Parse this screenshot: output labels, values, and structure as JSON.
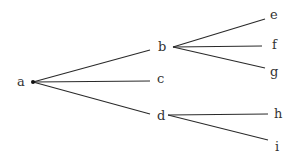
{
  "diagram": {
    "type": "tree",
    "nodes": [
      {
        "id": "a",
        "label": "a",
        "x": 17,
        "y": 86,
        "anchor": [
          33,
          82
        ]
      },
      {
        "id": "b",
        "label": "b",
        "x": 158,
        "y": 51,
        "anchor": [
          173,
          47
        ]
      },
      {
        "id": "c",
        "label": "c",
        "x": 157,
        "y": 83,
        "anchor": [
          150,
          80
        ]
      },
      {
        "id": "d",
        "label": "d",
        "x": 157,
        "y": 120,
        "anchor": [
          170,
          115
        ]
      },
      {
        "id": "e",
        "label": "e",
        "x": 270,
        "y": 19,
        "anchor": [
          264,
          19
        ]
      },
      {
        "id": "f",
        "label": "f",
        "x": 272,
        "y": 49,
        "anchor": [
          262,
          45
        ]
      },
      {
        "id": "g",
        "label": "g",
        "x": 270,
        "y": 76,
        "anchor": [
          264,
          68
        ]
      },
      {
        "id": "h",
        "label": "h",
        "x": 274,
        "y": 118,
        "anchor": [
          267,
          114
        ]
      },
      {
        "id": "i",
        "label": "i",
        "x": 275,
        "y": 151,
        "anchor": [
          267,
          140
        ]
      }
    ],
    "edges": [
      {
        "from": "a",
        "to": "b",
        "x1": 33,
        "y1": 82,
        "x2": 150,
        "y2": 50
      },
      {
        "from": "a",
        "to": "c",
        "x1": 33,
        "y1": 82,
        "x2": 150,
        "y2": 81
      },
      {
        "from": "a",
        "to": "d",
        "x1": 33,
        "y1": 82,
        "x2": 150,
        "y2": 114
      },
      {
        "from": "b",
        "to": "e",
        "x1": 173,
        "y1": 47,
        "x2": 265,
        "y2": 19
      },
      {
        "from": "b",
        "to": "f",
        "x1": 173,
        "y1": 47,
        "x2": 262,
        "y2": 46
      },
      {
        "from": "b",
        "to": "g",
        "x1": 173,
        "y1": 47,
        "x2": 265,
        "y2": 68
      },
      {
        "from": "d",
        "to": "h",
        "x1": 168,
        "y1": 115,
        "x2": 268,
        "y2": 114
      },
      {
        "from": "d",
        "to": "i",
        "x1": 168,
        "y1": 115,
        "x2": 268,
        "y2": 140
      }
    ],
    "root_dot": {
      "x": 33,
      "y": 82
    }
  }
}
